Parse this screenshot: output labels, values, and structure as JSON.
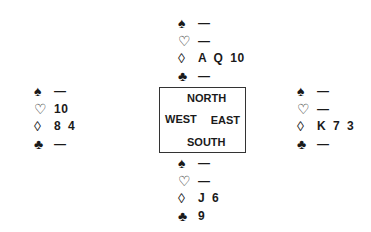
{
  "diagram_type": "bridge-deal",
  "compass": {
    "north_label": "NORTH",
    "south_label": "SOUTH",
    "west_label": "WEST",
    "east_label": "EAST"
  },
  "suit_symbols": {
    "spades": "♠",
    "hearts": "♡",
    "diamonds": "◊",
    "clubs": "♣"
  },
  "hands": {
    "north": {
      "spades": "—",
      "hearts": "—",
      "diamonds": "A Q 10",
      "clubs": "—"
    },
    "west": {
      "spades": "—",
      "hearts": "10",
      "diamonds": "8 4",
      "clubs": "—"
    },
    "east": {
      "spades": "—",
      "hearts": "—",
      "diamonds": "K 7 3",
      "clubs": "—"
    },
    "south": {
      "spades": "—",
      "hearts": "—",
      "diamonds": "J 6",
      "clubs": "9"
    }
  }
}
